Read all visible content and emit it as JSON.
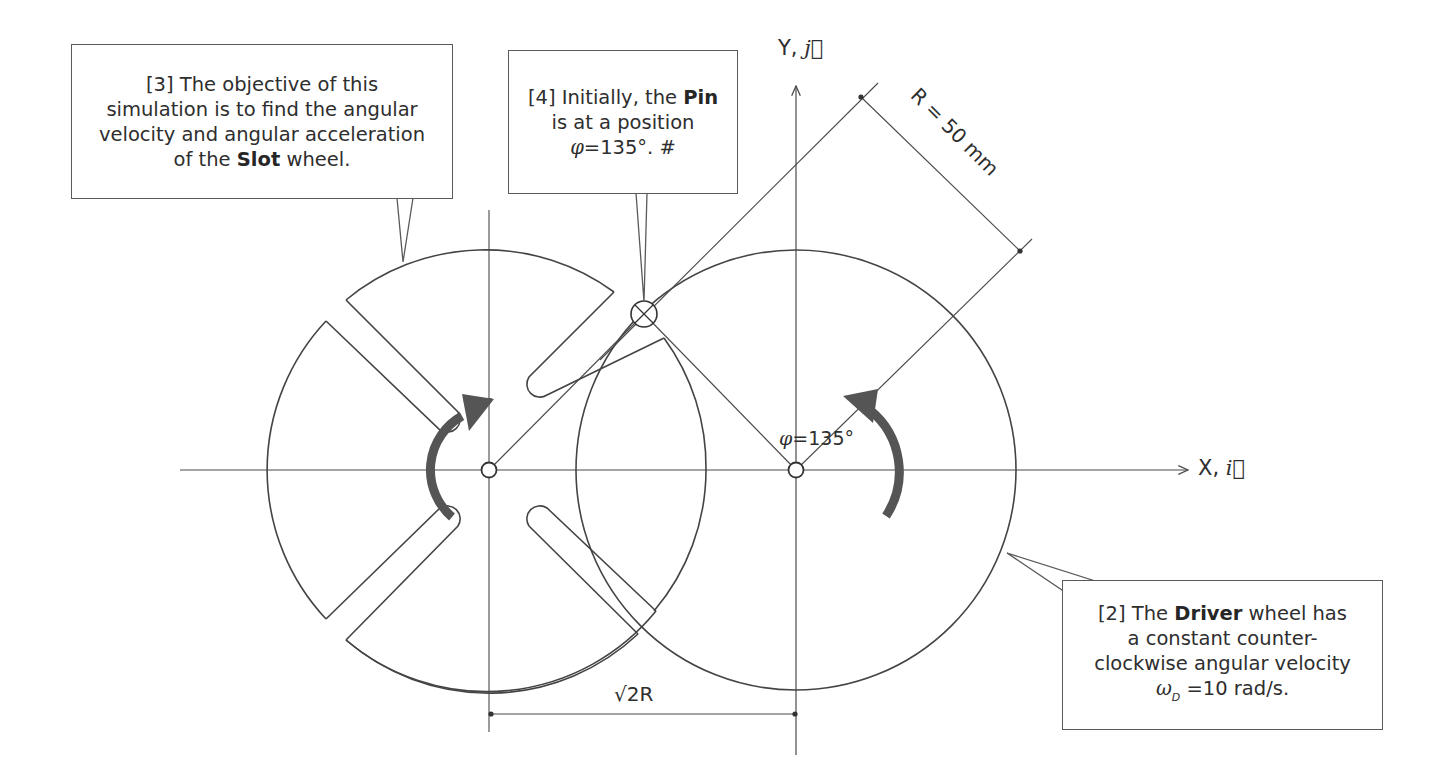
{
  "callouts": {
    "slot_objective": {
      "number": "[3]",
      "lines": [
        "The objective of this",
        "simulation is to find the angular",
        "velocity and angular acceleration"
      ],
      "last_line_prefix": "of the",
      "last_line_bold": "Slot",
      "last_line_suffix": "wheel."
    },
    "pin_initial": {
      "number": "[4]",
      "line1_prefix": "Initially, the",
      "line1_bold": "Pin",
      "line2": "is at a position",
      "symbol": "φ",
      "equation": "=135°.",
      "suffix": "#"
    },
    "driver_wheel": {
      "number": "[2]",
      "line1_prefix": "The",
      "line1_bold": "Driver",
      "line1_suffix": "wheel has",
      "line2": "a constant counter-",
      "line3": "clockwise angular velocity",
      "symbol": "ω",
      "subscript": "D",
      "equation": "=10 rad/s."
    }
  },
  "axes": {
    "y_label": "Y,",
    "y_unit_vector": "j⃗",
    "x_label": "X,",
    "x_unit_vector": "i⃗"
  },
  "dimensions": {
    "radius_label": "R = 50 mm",
    "center_distance_label": "√2R",
    "angle_symbol": "φ",
    "angle_value": "=135°"
  },
  "geometry": {
    "slot_wheel_center": [
      489,
      470
    ],
    "driver_center": [
      796,
      470
    ],
    "slot_wheel_radius": 218,
    "driver_radius": 220,
    "pin_position": [
      644,
      314
    ],
    "initial_angle_deg": 135,
    "slot_angles_deg": [
      45,
      135,
      225,
      315
    ]
  },
  "colors": {
    "line": "#4a4a4a",
    "arrow": "#555555",
    "text": "#2e2e2e"
  }
}
